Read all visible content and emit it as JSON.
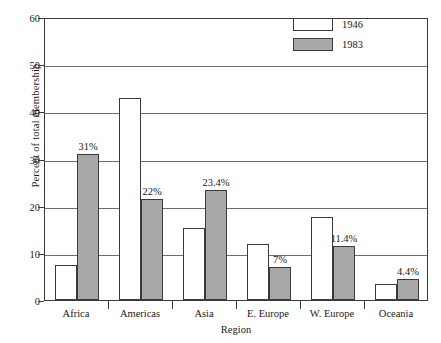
{
  "chart_data": {
    "type": "bar",
    "title": "",
    "xlabel": "Region",
    "ylabel": "Percent of total membership",
    "categories": [
      "Africa",
      "Americas",
      "Asia",
      "E. Europe",
      "W. Europe",
      "Oceania"
    ],
    "series": [
      {
        "name": "1946",
        "values": [
          7.5,
          42.8,
          15.3,
          11.8,
          17.5,
          3.5
        ],
        "color": "#ffffff",
        "labels": [
          "",
          "",
          "",
          "",
          "",
          ""
        ]
      },
      {
        "name": "1983",
        "values": [
          31,
          21.5,
          23.4,
          7,
          11.4,
          4.4
        ],
        "color": "#a8a8a8",
        "labels": [
          "31%",
          "22%",
          "23.4%",
          "7%",
          "11.4%",
          "4.4%"
        ]
      }
    ],
    "ylim": [
      0,
      60
    ],
    "yticks": [
      0,
      10,
      20,
      30,
      40,
      50,
      60
    ],
    "ytick_labels": [
      "0",
      "10",
      "20",
      "30",
      "40",
      "50",
      "60"
    ],
    "grid": true,
    "legend_position": "top-right",
    "axis_color": "#3a3a3a",
    "gridline_color": "#6f6f6f"
  }
}
